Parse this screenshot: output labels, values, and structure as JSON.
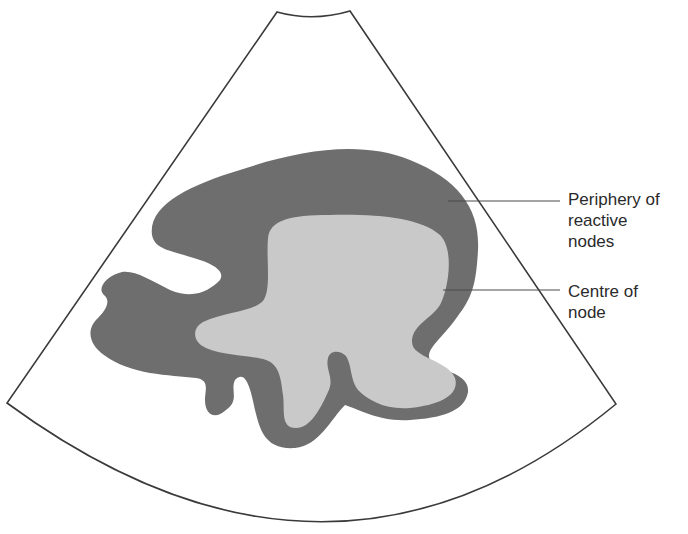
{
  "diagram": {
    "colors": {
      "background": "#ffffff",
      "sector_outline": "#3a3a3a",
      "periphery_fill": "#6e6e6e",
      "centre_fill": "#c9c9c9",
      "leader_line": "#4a4a4a"
    },
    "labels": {
      "periphery": {
        "line1": "Periphery of",
        "line2": "reactive",
        "line3": "nodes"
      },
      "centre": {
        "line1": "Centre of",
        "line2": "node"
      }
    }
  }
}
